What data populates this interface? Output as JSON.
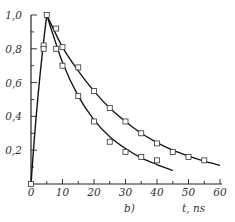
{
  "chart_data": {
    "type": "line",
    "title": "",
    "panel_label": "b)",
    "xlabel": "t, ns",
    "ylabel": "",
    "xlim": [
      0,
      60
    ],
    "ylim": [
      0,
      1.0
    ],
    "x_ticks": [
      0,
      10,
      20,
      30,
      40,
      50,
      60
    ],
    "x_tick_labels": [
      "0",
      "10",
      "20",
      "30",
      "40",
      "50",
      "60"
    ],
    "y_ticks": [
      0.2,
      0.4,
      0.6,
      0.8,
      1.0
    ],
    "y_tick_labels": [
      "0,2",
      "0,4",
      "0,6",
      "0,8",
      "1,0"
    ],
    "grid": false,
    "legend": null,
    "rise": {
      "x": [
        0,
        5
      ],
      "y": [
        0.0,
        1.0
      ]
    },
    "series": [
      {
        "name": "upper-curve",
        "curve": {
          "x": [
            5,
            10,
            15,
            20,
            25,
            30,
            35,
            40,
            45,
            50,
            55,
            60
          ],
          "y": [
            1.0,
            0.81,
            0.67,
            0.55,
            0.45,
            0.37,
            0.3,
            0.245,
            0.2,
            0.165,
            0.135,
            0.11
          ]
        },
        "points": {
          "x": [
            8,
            10,
            15,
            20,
            25,
            30,
            35,
            40,
            45,
            50,
            55
          ],
          "y": [
            0.92,
            0.81,
            0.69,
            0.55,
            0.45,
            0.37,
            0.3,
            0.24,
            0.19,
            0.16,
            0.14
          ]
        }
      },
      {
        "name": "lower-curve",
        "curve": {
          "x": [
            5,
            10,
            15,
            20,
            25,
            30,
            35,
            40,
            45
          ],
          "y": [
            1.0,
            0.72,
            0.52,
            0.38,
            0.28,
            0.21,
            0.155,
            0.115,
            0.08
          ]
        },
        "points": {
          "x": [
            0,
            4,
            4,
            8,
            10,
            15,
            20,
            25,
            30,
            35,
            40
          ],
          "y": [
            0.0,
            0.82,
            0.8,
            0.8,
            0.7,
            0.52,
            0.37,
            0.25,
            0.19,
            0.16,
            0.14
          ]
        }
      }
    ],
    "peak_marker": {
      "x": 5,
      "y": 1.0
    }
  }
}
